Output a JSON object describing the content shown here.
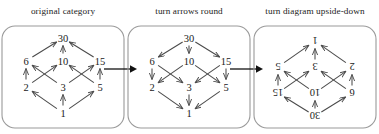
{
  "figure": {
    "panel_count": 3,
    "connector_icon": "right-arrow-icon",
    "colors": {
      "node_text": "#1a1a1a",
      "edge": "#4a4a4a",
      "box_border": "#9a9a9a",
      "connector": "#111111",
      "background": "#ffffff"
    }
  },
  "panels": [
    {
      "caption": "original category",
      "direction": "up",
      "rotated": false,
      "nodes": [
        {
          "id": "30",
          "label": "30",
          "x": 63,
          "y": 14
        },
        {
          "id": "6",
          "label": "6",
          "x": 26,
          "y": 37
        },
        {
          "id": "10",
          "label": "10",
          "x": 63,
          "y": 37
        },
        {
          "id": "15",
          "label": "15",
          "x": 100,
          "y": 37
        },
        {
          "id": "2",
          "label": "2",
          "x": 26,
          "y": 63
        },
        {
          "id": "3",
          "label": "3",
          "x": 63,
          "y": 63
        },
        {
          "id": "5",
          "label": "5",
          "x": 100,
          "y": 63
        },
        {
          "id": "1",
          "label": "1",
          "x": 63,
          "y": 89
        }
      ],
      "edges": [
        {
          "from": "1",
          "to": "2"
        },
        {
          "from": "1",
          "to": "3"
        },
        {
          "from": "1",
          "to": "5"
        },
        {
          "from": "2",
          "to": "6"
        },
        {
          "from": "2",
          "to": "10"
        },
        {
          "from": "3",
          "to": "6"
        },
        {
          "from": "3",
          "to": "15"
        },
        {
          "from": "5",
          "to": "10"
        },
        {
          "from": "5",
          "to": "15"
        },
        {
          "from": "6",
          "to": "30"
        },
        {
          "from": "10",
          "to": "30"
        },
        {
          "from": "15",
          "to": "30"
        }
      ]
    },
    {
      "caption": "turn arrows round",
      "direction": "down",
      "rotated": false,
      "nodes": [
        {
          "id": "30",
          "label": "30",
          "x": 63,
          "y": 14
        },
        {
          "id": "6",
          "label": "6",
          "x": 26,
          "y": 37
        },
        {
          "id": "10",
          "label": "10",
          "x": 63,
          "y": 37
        },
        {
          "id": "15",
          "label": "15",
          "x": 100,
          "y": 37
        },
        {
          "id": "2",
          "label": "2",
          "x": 26,
          "y": 63
        },
        {
          "id": "3",
          "label": "3",
          "x": 63,
          "y": 63
        },
        {
          "id": "5",
          "label": "5",
          "x": 100,
          "y": 63
        },
        {
          "id": "1",
          "label": "1",
          "x": 63,
          "y": 89
        }
      ],
      "edges": [
        {
          "from": "30",
          "to": "6"
        },
        {
          "from": "30",
          "to": "10"
        },
        {
          "from": "30",
          "to": "15"
        },
        {
          "from": "6",
          "to": "2"
        },
        {
          "from": "6",
          "to": "3"
        },
        {
          "from": "10",
          "to": "2"
        },
        {
          "from": "10",
          "to": "5"
        },
        {
          "from": "15",
          "to": "3"
        },
        {
          "from": "15",
          "to": "5"
        },
        {
          "from": "2",
          "to": "1"
        },
        {
          "from": "3",
          "to": "1"
        },
        {
          "from": "5",
          "to": "1"
        }
      ]
    },
    {
      "caption": "turn diagram upside-down",
      "direction": "down",
      "rotated": true,
      "nodes": [
        {
          "id": "30",
          "label": "30",
          "x": 63,
          "y": 14
        },
        {
          "id": "6",
          "label": "6",
          "x": 26,
          "y": 37
        },
        {
          "id": "10",
          "label": "10",
          "x": 63,
          "y": 37
        },
        {
          "id": "15",
          "label": "15",
          "x": 100,
          "y": 37
        },
        {
          "id": "2",
          "label": "2",
          "x": 26,
          "y": 63
        },
        {
          "id": "3",
          "label": "3",
          "x": 63,
          "y": 63
        },
        {
          "id": "5",
          "label": "5",
          "x": 100,
          "y": 63
        },
        {
          "id": "1",
          "label": "1",
          "x": 63,
          "y": 89
        }
      ],
      "edges": [
        {
          "from": "30",
          "to": "6"
        },
        {
          "from": "30",
          "to": "10"
        },
        {
          "from": "30",
          "to": "15"
        },
        {
          "from": "6",
          "to": "2"
        },
        {
          "from": "6",
          "to": "3"
        },
        {
          "from": "10",
          "to": "2"
        },
        {
          "from": "10",
          "to": "5"
        },
        {
          "from": "15",
          "to": "3"
        },
        {
          "from": "15",
          "to": "5"
        },
        {
          "from": "2",
          "to": "1"
        },
        {
          "from": "3",
          "to": "1"
        },
        {
          "from": "5",
          "to": "1"
        }
      ]
    }
  ]
}
